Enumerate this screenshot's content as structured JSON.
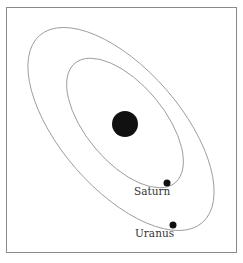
{
  "diagram": {
    "colors": {
      "frame": "#8a8a8a",
      "orbit": "#9a9a9a",
      "body": "#111111",
      "label": "#333333"
    },
    "central_body": {
      "name": "Sun",
      "cx": 125,
      "cy": 124,
      "r": 13
    },
    "orbits": [
      {
        "name": "inner-orbit",
        "cx": 125,
        "cy": 123,
        "rx": 78,
        "ry": 39,
        "rotation": 50
      },
      {
        "name": "outer-orbit",
        "cx": 121,
        "cy": 129,
        "rx": 124,
        "ry": 60,
        "rotation": 49
      }
    ],
    "planets": [
      {
        "label": "Saturn",
        "cx": 167,
        "cy": 183,
        "r": 3.5,
        "label_x": 134,
        "label_y": 186
      },
      {
        "label": "Uranus",
        "cx": 173,
        "cy": 225,
        "r": 3.5,
        "label_x": 135,
        "label_y": 228
      }
    ]
  }
}
